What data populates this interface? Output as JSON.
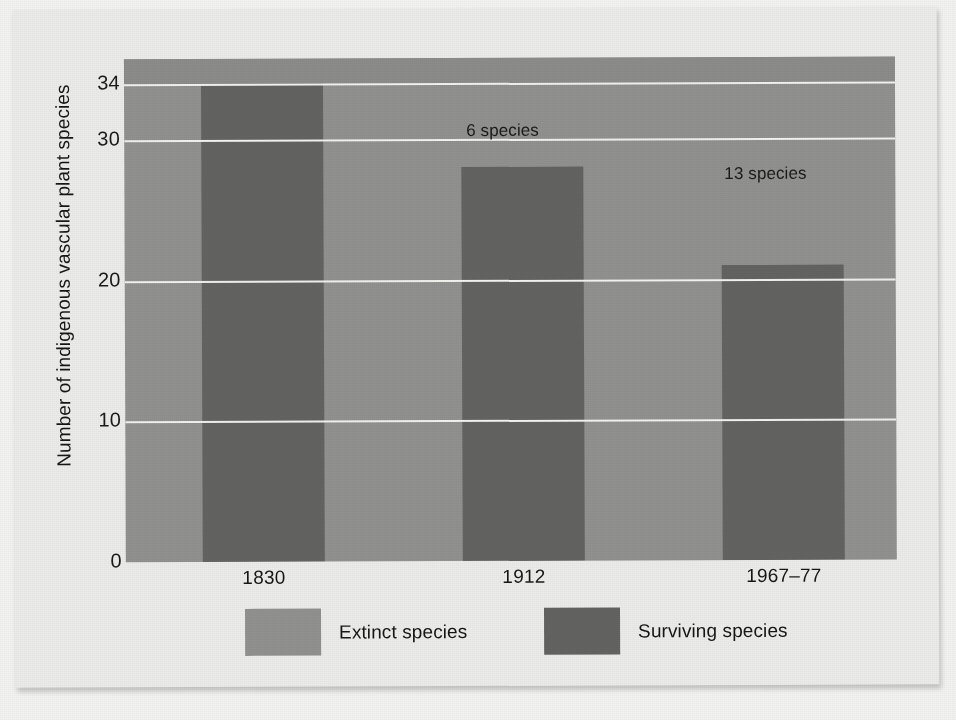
{
  "chart_data": {
    "type": "bar",
    "subtype": "stacked",
    "title": "",
    "xlabel": "",
    "ylabel": "Number of indigenous vascular plant species",
    "categories": [
      "1830",
      "1912",
      "1967–77"
    ],
    "ylim": [
      0,
      34
    ],
    "yticks": [
      "0",
      "10",
      "20",
      "30",
      "34"
    ],
    "ytick_values": [
      0,
      10,
      20,
      30,
      34
    ],
    "grid": true,
    "gridlines_at": [
      10,
      20,
      30,
      34
    ],
    "legend_position": "bottom",
    "series": [
      {
        "name": "Extinct species",
        "values": [
          0,
          6,
          13
        ],
        "color": "#919190"
      },
      {
        "name": "Surviving species",
        "values": [
          34,
          28,
          21
        ],
        "color": "#636362"
      }
    ],
    "totals": [
      34,
      34,
      34
    ],
    "annotations": [
      {
        "category": "1912",
        "text": "6 species"
      },
      {
        "category": "1967–77",
        "text": "13 species"
      }
    ]
  },
  "axis": {
    "y_title": "Number of indigenous vascular plant species",
    "y_ticks": [
      {
        "label": "34",
        "value": 34
      },
      {
        "label": "30",
        "value": 30
      },
      {
        "label": "20",
        "value": 20
      },
      {
        "label": "10",
        "value": 10
      },
      {
        "label": "0",
        "value": 0
      }
    ],
    "x_labels": [
      "1830",
      "1912",
      "1967–77"
    ]
  },
  "legend": {
    "entries": [
      {
        "label": "Extinct species",
        "swatch": "extinct"
      },
      {
        "label": "Surviving species",
        "swatch": "surviving"
      }
    ]
  },
  "annotations": {
    "bar2": "6 species",
    "bar3": "13 species"
  },
  "colors": {
    "extinct": "#919190",
    "surviving": "#636362",
    "gridline": "#f2f2ef",
    "plot_background": "#919190",
    "page_background": "#ececeb"
  }
}
